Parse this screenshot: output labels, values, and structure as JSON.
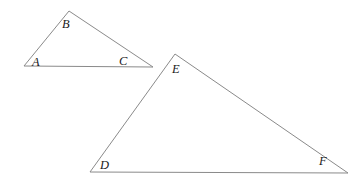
{
  "diagram": {
    "background_color": "#ffffff",
    "stroke_color": "#8a8a8a",
    "stroke_width": 1,
    "label_color": "#1a1a1a",
    "shapes": [
      {
        "name": "triangle-abc",
        "type": "triangle",
        "points": "24,66 69,11 153,67",
        "vertices": [
          {
            "label": "A",
            "x": 24,
            "y": 66,
            "label_x": 32,
            "label_y": 56
          },
          {
            "label": "B",
            "x": 69,
            "y": 11,
            "label_x": 62,
            "label_y": 18
          },
          {
            "label": "C",
            "x": 153,
            "y": 67,
            "label_x": 119,
            "label_y": 55
          }
        ]
      },
      {
        "name": "triangle-def",
        "type": "triangle",
        "points": "90,172 175,54 348,173",
        "vertices": [
          {
            "label": "D",
            "x": 90,
            "y": 172,
            "label_x": 100,
            "label_y": 159
          },
          {
            "label": "E",
            "x": 175,
            "y": 54,
            "label_x": 172,
            "label_y": 63
          },
          {
            "label": "F",
            "x": 348,
            "y": 173,
            "label_x": 319,
            "label_y": 155
          }
        ]
      }
    ]
  }
}
